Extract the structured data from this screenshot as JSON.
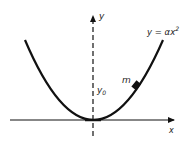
{
  "diagram": {
    "curve_label": "y = αx²",
    "curve_label_parts": {
      "lhs": "y = αx",
      "exponent": "2"
    },
    "y_axis_label": "y",
    "x_axis_label": "x",
    "mass_label": "m",
    "height_label": {
      "base": "y",
      "subscript": "0"
    },
    "colors": {
      "ink": "#111111",
      "background": "#ffffff"
    }
  }
}
